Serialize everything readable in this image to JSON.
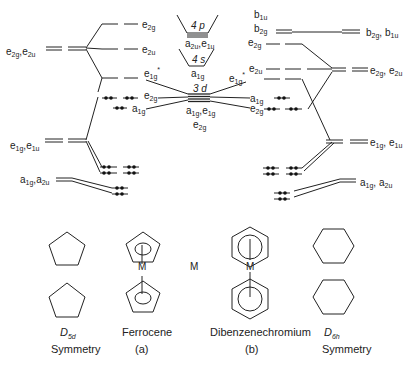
{
  "diagram": {
    "type": "molecular-orbital-energy-level-diagram",
    "left_ligand": {
      "symmetry_label": "D",
      "symmetry_sub": "5d",
      "caption": "Symmetry",
      "levels": [
        "e2g,e2u",
        "e1g,e1u",
        "a1g,a2u"
      ]
    },
    "right_ligand": {
      "symmetry_label": "D",
      "symmetry_sub": "6h",
      "caption": "Symmetry",
      "levels": [
        "b2g,b1u",
        "e2g,e2u",
        "e1g,e1u",
        "a1g,a2u"
      ]
    },
    "metal": {
      "label": "M",
      "orbitals": [
        {
          "name": "4p",
          "symmetry": "a2u,e1u"
        },
        {
          "name": "4s",
          "symmetry": "a1g"
        },
        {
          "name": "3d",
          "symmetry": "a1g,e1g",
          "symmetry2": "e2g"
        }
      ]
    },
    "complex_a": {
      "name": "Ferrocene",
      "tag": "(a)",
      "metal_label": "M",
      "mo_levels": [
        "e2g",
        "e2u",
        "e1g*",
        "e2g",
        "a1g"
      ]
    },
    "complex_b": {
      "name": "Dibenzenechromium",
      "tag": "(b)",
      "metal_label": "M",
      "mo_levels": [
        "b1u",
        "b2g",
        "e2g",
        "e2u",
        "e1g*",
        "a1g",
        "e2g"
      ]
    }
  }
}
